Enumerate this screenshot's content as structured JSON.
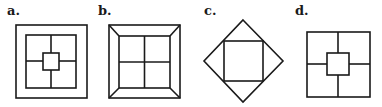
{
  "figures": [
    {
      "label": "a.",
      "description": "square within square divided into four quadrants with small central square"
    },
    {
      "label": "b.",
      "description": "square frame with corner diagonals around a square divided into four quadrants"
    },
    {
      "label": "c.",
      "description": "diamond with inscribed square"
    },
    {
      "label": "d.",
      "description": "square divided into four quadrants with small central square"
    }
  ],
  "colors": {
    "stroke": "#1a1a1a",
    "background": "#ffffff"
  }
}
